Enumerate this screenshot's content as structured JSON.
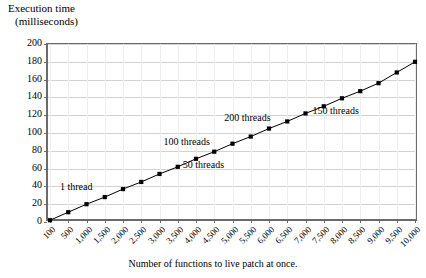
{
  "chart_data": {
    "type": "line",
    "title": "",
    "ylabel_line1": "Execution time",
    "ylabel_line2": "(milliseconds)",
    "xlabel": "Number of functions to live patch at once.",
    "ylim": [
      0,
      200
    ],
    "ytick_step": 20,
    "yticks": [
      "200",
      "180",
      "160",
      "140",
      "120",
      "100",
      "80",
      "60",
      "40",
      "20",
      "0"
    ],
    "grid": true,
    "legend": "none",
    "categories": [
      "100",
      "500",
      "1,000",
      "1,500",
      "2,000",
      "2,500",
      "3,000",
      "3,500",
      "4,000",
      "4,500",
      "5,000",
      "5,500",
      "6,000",
      "6,500",
      "7,000",
      "7,500",
      "8,000",
      "8,500",
      "9,000",
      "9,500",
      "10,000"
    ],
    "values": [
      2,
      11,
      20,
      28,
      37,
      45,
      54,
      62,
      71,
      79,
      88,
      96,
      105,
      113,
      122,
      130,
      139,
      147,
      156,
      168,
      180
    ],
    "series": [
      {
        "name": "execution time",
        "marker": "square",
        "color": "#000000",
        "values": [
          2,
          11,
          20,
          28,
          37,
          45,
          54,
          62,
          71,
          79,
          88,
          96,
          105,
          113,
          122,
          130,
          139,
          147,
          156,
          168,
          180
        ]
      }
    ],
    "annotations": [
      {
        "text": "1 thread",
        "x_index": 4,
        "x_value": "2,000",
        "y_value": 37
      },
      {
        "text": "50 threads",
        "x_index": 7,
        "x_value": "3,500",
        "y_value": 62
      },
      {
        "text": "100 threads",
        "x_index": 10,
        "x_value": "5,000",
        "y_value": 88
      },
      {
        "text": "150 threads",
        "x_index": 14,
        "x_value": "7,000",
        "y_value": 122
      },
      {
        "text": "200 threads",
        "x_index": 13,
        "x_value": "6,500",
        "y_value": 113
      }
    ]
  }
}
